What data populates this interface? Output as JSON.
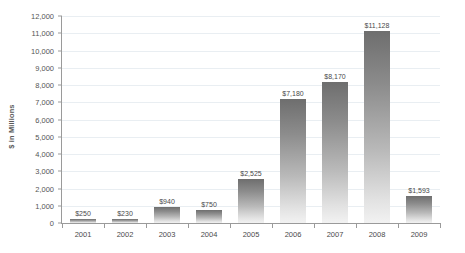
{
  "chart_data": {
    "type": "bar",
    "title": "",
    "xlabel": "",
    "ylabel": "$ in Millions",
    "ylim": [
      0,
      12000
    ],
    "ytick_step": 1000,
    "grid": true,
    "legend": "none",
    "categories": [
      "2001",
      "2002",
      "2003",
      "2004",
      "2005",
      "2006",
      "2007",
      "2008",
      "2009"
    ],
    "values": [
      250,
      230,
      940,
      750,
      2525,
      7180,
      8170,
      11128,
      1593
    ],
    "value_labels": [
      "$250",
      "$230",
      "$940",
      "$750",
      "$2,525",
      "$7,180",
      "$8,170",
      "$11,128",
      "$1,593"
    ],
    "ytick_labels": [
      "12,000",
      "11,000",
      "10,000",
      "9,000",
      "8,000",
      "7,000",
      "6,000",
      "5,000",
      "4,000",
      "3,000",
      "2,000",
      "1,000",
      "0"
    ],
    "colors": {
      "bar_top": "#6e6e6e",
      "bar_bottom": "#f2f2f2",
      "gridline": "#e9eef2",
      "axis": "#9a9a9a",
      "text": "#4a4a4a",
      "background": "#ffffff"
    }
  }
}
